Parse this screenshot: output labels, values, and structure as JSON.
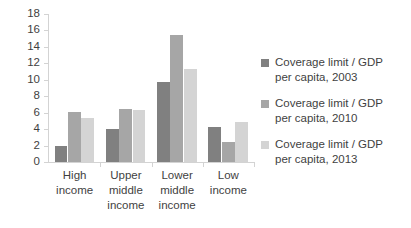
{
  "chart_data": {
    "type": "bar",
    "title": "",
    "xlabel": "",
    "ylabel": "",
    "categories": [
      "High income",
      "Upper middle income",
      "Lower middle income",
      "Low income"
    ],
    "category_lines": [
      [
        "High",
        "income"
      ],
      [
        "Upper",
        "middle",
        "income"
      ],
      [
        "Lower",
        "middle",
        "income"
      ],
      [
        "Low",
        "income"
      ]
    ],
    "series": [
      {
        "name": "Coverage limit / GDP per capita, 2003",
        "name_lines": "Coverage limit / GDP\nper capita, 2003",
        "color": "#808080",
        "values": [
          1.9,
          4.0,
          9.7,
          4.3
        ]
      },
      {
        "name": "Coverage limit / GDP per capita, 2010",
        "name_lines": "Coverage limit / GDP\nper capita, 2010",
        "color": "#a6a6a6",
        "values": [
          6.1,
          6.4,
          15.5,
          2.4
        ]
      },
      {
        "name": "Coverage limit / GDP per capita, 2013",
        "name_lines": "Coverage limit / GDP\nper capita, 2013",
        "color": "#d4d4d4",
        "values": [
          5.3,
          6.3,
          11.3,
          4.9
        ]
      }
    ],
    "ylim": [
      0,
      18
    ],
    "ytick_values": [
      0,
      2,
      4,
      6,
      8,
      10,
      12,
      14,
      16,
      18
    ],
    "ytick_labels": [
      "0",
      "2",
      "4",
      "6",
      "8",
      "10",
      "12",
      "14",
      "16",
      "18"
    ],
    "grid": false,
    "legend_position": "right",
    "axis_color": "#d3d3d3"
  }
}
